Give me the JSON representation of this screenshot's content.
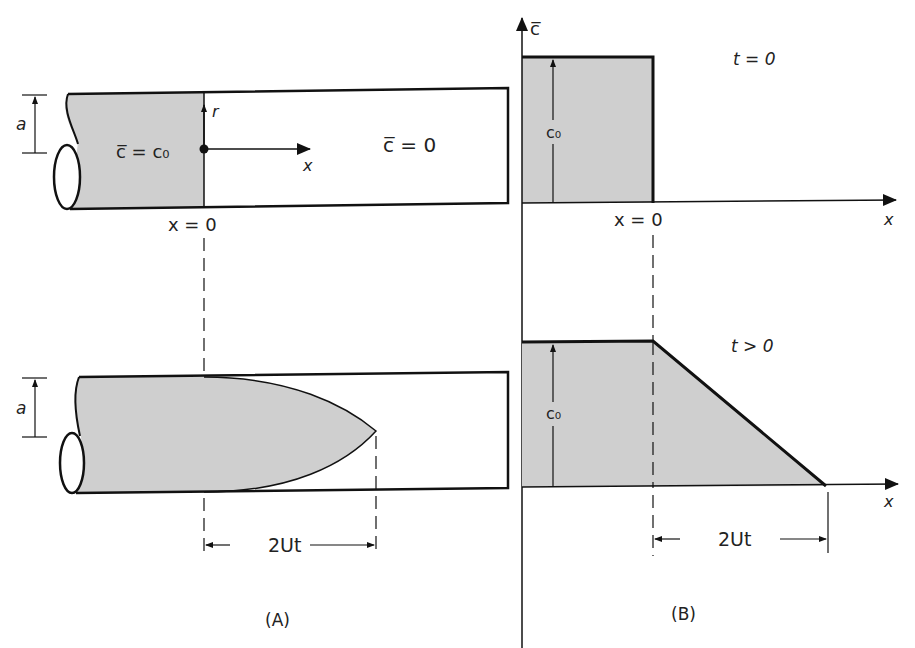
{
  "panel_a": {
    "caption": "(A)",
    "top": {
      "radius_label": "a",
      "r_axis_label": "r",
      "x_axis_label": "x",
      "shaded_region_label": "c̅ = c₀",
      "clear_region_label": "c̅ = 0",
      "origin_label": "x = 0"
    },
    "bottom": {
      "radius_label": "a",
      "extent_label": "2Ut"
    }
  },
  "panel_b": {
    "caption": "(B)",
    "y_axis_label": "c̅",
    "top": {
      "time_label": "t = 0",
      "height_label": "c₀",
      "origin_label": "x = 0",
      "x_axis_label": "x"
    },
    "bottom": {
      "time_label": "t > 0",
      "height_label": "c₀",
      "x_axis_label": "x",
      "extent_label": "2Ut"
    }
  },
  "colors": {
    "shade": "#cfcfcf",
    "ink": "#111111"
  }
}
